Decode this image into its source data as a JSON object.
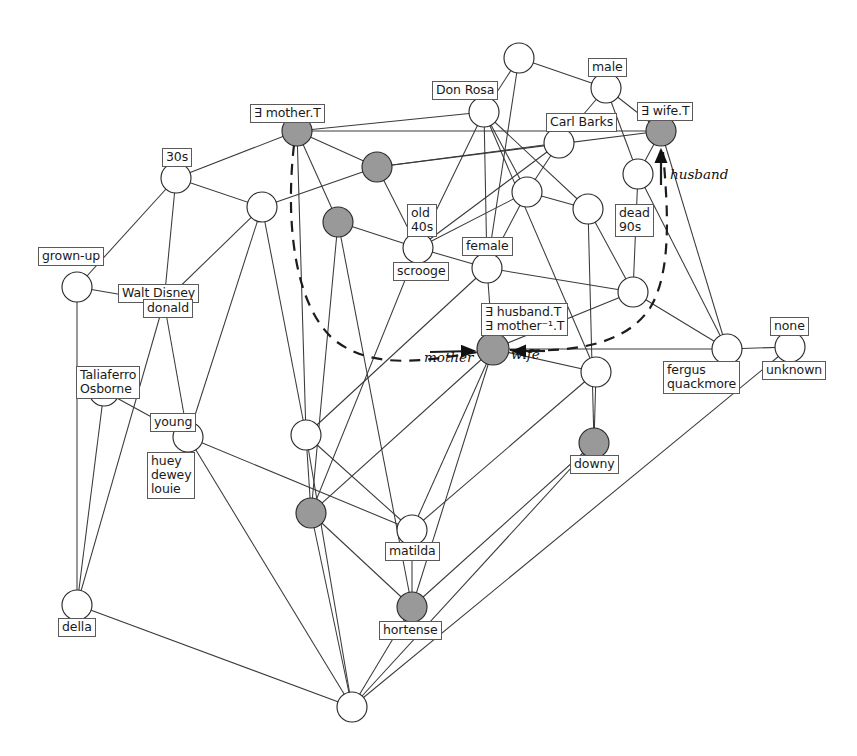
{
  "diagram": {
    "type": "concept-lattice",
    "colors": {
      "node_fill_open": "#ffffff",
      "node_fill_shaded": "#999999",
      "node_stroke": "#2b2b2b",
      "edge": "#3a3a3a",
      "dashed_edge": "#1c1c1c",
      "label_border": "#5a5a5a",
      "background": "#ffffff"
    },
    "nodes": [
      {
        "id": "n0",
        "x": 519,
        "y": 58,
        "r": 15,
        "shaded": false
      },
      {
        "id": "n1",
        "x": 606,
        "y": 88,
        "r": 15,
        "shaded": false
      },
      {
        "id": "n2",
        "x": 484,
        "y": 112,
        "r": 15,
        "shaded": false
      },
      {
        "id": "n3",
        "x": 297,
        "y": 131,
        "r": 15,
        "shaded": true
      },
      {
        "id": "n4",
        "x": 661,
        "y": 131,
        "r": 15,
        "shaded": true
      },
      {
        "id": "n5",
        "x": 559,
        "y": 143,
        "r": 15,
        "shaded": false
      },
      {
        "id": "n6",
        "x": 377,
        "y": 167,
        "r": 15,
        "shaded": true
      },
      {
        "id": "n7",
        "x": 176,
        "y": 178,
        "r": 15,
        "shaded": false
      },
      {
        "id": "n8",
        "x": 262,
        "y": 207,
        "r": 15,
        "shaded": false
      },
      {
        "id": "n9",
        "x": 527,
        "y": 192,
        "r": 15,
        "shaded": false
      },
      {
        "id": "n10",
        "x": 588,
        "y": 209,
        "r": 15,
        "shaded": false
      },
      {
        "id": "n11",
        "x": 638,
        "y": 174,
        "r": 15,
        "shaded": false
      },
      {
        "id": "n12",
        "x": 338,
        "y": 222,
        "r": 15,
        "shaded": true
      },
      {
        "id": "n13",
        "x": 418,
        "y": 248,
        "r": 15,
        "shaded": false
      },
      {
        "id": "n14",
        "x": 487,
        "y": 268,
        "r": 15,
        "shaded": false
      },
      {
        "id": "n15",
        "x": 633,
        "y": 292,
        "r": 15,
        "shaded": false
      },
      {
        "id": "n16",
        "x": 77,
        "y": 287,
        "r": 15,
        "shaded": false
      },
      {
        "id": "n17",
        "x": 164,
        "y": 302,
        "r": 15,
        "shaded": false
      },
      {
        "id": "n18",
        "x": 104,
        "y": 391,
        "r": 15,
        "shaded": false
      },
      {
        "id": "n19",
        "x": 188,
        "y": 437,
        "r": 15,
        "shaded": false
      },
      {
        "id": "n20",
        "x": 493,
        "y": 349,
        "r": 16,
        "shaded": true
      },
      {
        "id": "n21",
        "x": 727,
        "y": 349,
        "r": 15,
        "shaded": false
      },
      {
        "id": "n22",
        "x": 790,
        "y": 347,
        "r": 15,
        "shaded": false
      },
      {
        "id": "n23",
        "x": 306,
        "y": 435,
        "r": 15,
        "shaded": false
      },
      {
        "id": "n24",
        "x": 596,
        "y": 372,
        "r": 15,
        "shaded": false
      },
      {
        "id": "n25",
        "x": 594,
        "y": 443,
        "r": 15,
        "shaded": true
      },
      {
        "id": "n26",
        "x": 311,
        "y": 513,
        "r": 15,
        "shaded": true
      },
      {
        "id": "n27",
        "x": 412,
        "y": 530,
        "r": 15,
        "shaded": false
      },
      {
        "id": "n28",
        "x": 412,
        "y": 607,
        "r": 15,
        "shaded": true
      },
      {
        "id": "n29",
        "x": 77,
        "y": 605,
        "r": 15,
        "shaded": false
      },
      {
        "id": "n30",
        "x": 352,
        "y": 707,
        "r": 15,
        "shaded": false
      }
    ],
    "edges": [
      [
        "n0",
        "n2"
      ],
      [
        "n0",
        "n1"
      ],
      [
        "n0",
        "n14"
      ],
      [
        "n1",
        "n5"
      ],
      [
        "n1",
        "n4"
      ],
      [
        "n1",
        "n11"
      ],
      [
        "n2",
        "n3"
      ],
      [
        "n2",
        "n14"
      ],
      [
        "n2",
        "n9"
      ],
      [
        "n2",
        "n10"
      ],
      [
        "n2",
        "n13"
      ],
      [
        "n2",
        "n24"
      ],
      [
        "n3",
        "n6"
      ],
      [
        "n3",
        "n7"
      ],
      [
        "n3",
        "n12"
      ],
      [
        "n3",
        "n23"
      ],
      [
        "n5",
        "n9"
      ],
      [
        "n5",
        "n13"
      ],
      [
        "n6",
        "n13"
      ],
      [
        "n6",
        "n5"
      ],
      [
        "n7",
        "n8"
      ],
      [
        "n7",
        "n16"
      ],
      [
        "n7",
        "n17"
      ],
      [
        "n8",
        "n6"
      ],
      [
        "n8",
        "n17"
      ],
      [
        "n8",
        "n19"
      ],
      [
        "n8",
        "n23"
      ],
      [
        "n9",
        "n13"
      ],
      [
        "n9",
        "n14"
      ],
      [
        "n9",
        "n10"
      ],
      [
        "n10",
        "n15"
      ],
      [
        "n10",
        "n25"
      ],
      [
        "n11",
        "n4"
      ],
      [
        "n11",
        "n15"
      ],
      [
        "n11",
        "n21"
      ],
      [
        "n12",
        "n13"
      ],
      [
        "n12",
        "n26"
      ],
      [
        "n13",
        "n14"
      ],
      [
        "n13",
        "n26"
      ],
      [
        "n14",
        "n20"
      ],
      [
        "n14",
        "n23"
      ],
      [
        "n14",
        "n15"
      ],
      [
        "n15",
        "n21"
      ],
      [
        "n15",
        "n20"
      ],
      [
        "n16",
        "n17"
      ],
      [
        "n16",
        "n29"
      ],
      [
        "n17",
        "n19"
      ],
      [
        "n17",
        "n29"
      ],
      [
        "n18",
        "n19"
      ],
      [
        "n18",
        "n29"
      ],
      [
        "n19",
        "n27"
      ],
      [
        "n19",
        "n30"
      ],
      [
        "n20",
        "n24"
      ],
      [
        "n20",
        "n26"
      ],
      [
        "n20",
        "n27"
      ],
      [
        "n20",
        "n21"
      ],
      [
        "n21",
        "n4"
      ],
      [
        "n21",
        "n22"
      ],
      [
        "n22",
        "n30"
      ],
      [
        "n23",
        "n26"
      ],
      [
        "n23",
        "n27"
      ],
      [
        "n23",
        "n30"
      ],
      [
        "n24",
        "n25"
      ],
      [
        "n24",
        "n27"
      ],
      [
        "n25",
        "n28"
      ],
      [
        "n25",
        "n30"
      ],
      [
        "n26",
        "n28"
      ],
      [
        "n26",
        "n30"
      ],
      [
        "n27",
        "n28"
      ],
      [
        "n28",
        "n30"
      ],
      [
        "n29",
        "n30"
      ],
      [
        "n12",
        "n28"
      ],
      [
        "n6",
        "n4"
      ],
      [
        "n3",
        "n4"
      ],
      [
        "n20",
        "n28"
      ]
    ],
    "dashed_path": "M 294,145 C 286,215 292,300 332,338 C 372,372 430,360 478,352",
    "dashed_path_right": "M 510,350 C 560,352 622,350 650,308 C 672,272 668,210 663,152",
    "arrow_edges": [
      {
        "name": "husband-arrow",
        "x1": 661,
        "y1": 185,
        "x2": 661,
        "y2": 150
      },
      {
        "name": "mother-arrow",
        "x1": 430,
        "y1": 352,
        "x2": 474,
        "y2": 351
      },
      {
        "name": "wife-arrow",
        "x1": 545,
        "y1": 351,
        "x2": 513,
        "y2": 351
      }
    ],
    "node_labels": [
      {
        "for": "n4",
        "name": "label-exists-wife-t",
        "text": "∃ wife.T",
        "x": 637,
        "y": 102,
        "align": "above"
      },
      {
        "for": "n1",
        "name": "label-male",
        "text": "male",
        "x": 588,
        "y": 58,
        "align": "above"
      },
      {
        "for": "n2",
        "name": "label-don-rosa",
        "text": "Don Rosa",
        "x": 432,
        "y": 81,
        "align": "above-left"
      },
      {
        "for": "n5",
        "name": "label-carl-barks",
        "text": "Carl Barks",
        "x": 546,
        "y": 113,
        "align": "above"
      },
      {
        "for": "n3",
        "name": "label-exists-mother-t",
        "text": "∃ mother.T",
        "x": 250,
        "y": 104,
        "align": "above"
      },
      {
        "for": "n7",
        "name": "label-30s",
        "text": "30s",
        "x": 162,
        "y": 148,
        "align": "above"
      },
      {
        "for": "n13",
        "name": "label-old-40s",
        "text": "old\n40s",
        "x": 407,
        "y": 204,
        "align": "above",
        "two_line": true
      },
      {
        "for": "n13",
        "name": "label-scrooge",
        "text": "scrooge",
        "x": 393,
        "y": 262,
        "align": "below"
      },
      {
        "for": "n14",
        "name": "label-female",
        "text": "female",
        "x": 462,
        "y": 237,
        "align": "above"
      },
      {
        "for": "n10",
        "name": "label-dead-90s",
        "text": "dead\n90s",
        "x": 615,
        "y": 204,
        "align": "right",
        "two_line": true
      },
      {
        "for": "n16",
        "name": "label-grown-up",
        "text": "grown-up",
        "x": 38,
        "y": 247,
        "align": "above"
      },
      {
        "for": "n17",
        "name": "label-walt-disney",
        "text": "Walt Disney",
        "x": 118,
        "y": 284,
        "align": "above"
      },
      {
        "for": "n17",
        "name": "label-donald",
        "text": "donald",
        "x": 143,
        "y": 299,
        "align": "below"
      },
      {
        "for": "n18",
        "name": "label-taliaferro",
        "text": "Taliaferro\nOsborne",
        "x": 76,
        "y": 366,
        "align": "above",
        "two_line": true
      },
      {
        "for": "n19",
        "name": "label-young",
        "text": "young",
        "x": 150,
        "y": 413,
        "align": "above"
      },
      {
        "for": "n19",
        "name": "label-huey-dewey-louie",
        "text": "huey\ndewey\nlouie",
        "x": 147,
        "y": 452,
        "align": "below",
        "three_line": true
      },
      {
        "for": "n20",
        "name": "label-exists-husband-mother",
        "text": "∃ husband.T\n∃ mother⁻¹.T",
        "x": 481,
        "y": 303,
        "align": "above",
        "two_line": true
      },
      {
        "for": "n21",
        "name": "label-fergus-quackmore",
        "text": "fergus\nquackmore",
        "x": 663,
        "y": 361,
        "align": "below",
        "two_line": true
      },
      {
        "for": "n22",
        "name": "label-none",
        "text": "none",
        "x": 770,
        "y": 317,
        "align": "above"
      },
      {
        "for": "n22",
        "name": "label-unknown",
        "text": "unknown",
        "x": 762,
        "y": 361,
        "align": "below"
      },
      {
        "for": "n25",
        "name": "label-downy",
        "text": "downy",
        "x": 570,
        "y": 455,
        "align": "below"
      },
      {
        "for": "n27",
        "name": "label-matilda",
        "text": "matilda",
        "x": 385,
        "y": 542,
        "align": "below"
      },
      {
        "for": "n28",
        "name": "label-hortense",
        "text": "hortense",
        "x": 379,
        "y": 621,
        "align": "below"
      },
      {
        "for": "n29",
        "name": "label-della",
        "text": "della",
        "x": 58,
        "y": 618,
        "align": "below"
      }
    ],
    "edge_labels": [
      {
        "name": "edge-label-husband",
        "text": "husband",
        "x": 670,
        "y": 166
      },
      {
        "name": "edge-label-mother",
        "text": "mother",
        "x": 424,
        "y": 349
      },
      {
        "name": "edge-label-wife",
        "text": "wife",
        "x": 511,
        "y": 346
      }
    ]
  }
}
